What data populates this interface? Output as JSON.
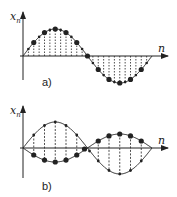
{
  "figure": {
    "panels": [
      {
        "id": "a",
        "label": "a)",
        "y_axis_label": "x",
        "y_axis_sub": "n",
        "x_axis_label": "n",
        "description": "One period of a sampled sine wave; dashed vertical stems from axis to each sample"
      },
      {
        "id": "b",
        "label": "b)",
        "y_axis_label": "x",
        "y_axis_sub": "n",
        "x_axis_label": "n",
        "description": "Two sampled half-period sinusoids of opposite sign and different amplitude, large samples marked on the small inverted curve"
      }
    ]
  },
  "colors": {
    "ink": "#222222",
    "background": "#ffffff"
  }
}
